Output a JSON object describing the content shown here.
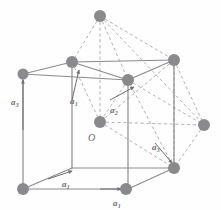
{
  "figure": {
    "type": "crystal-lattice-diagram",
    "width": 221,
    "height": 210,
    "background_color": "#fefefe",
    "solid_edge_color": "#8b8b8d",
    "dashed_edge_color": "#a9a9ab",
    "node_color": "#8a8a8c",
    "label_color": "#6e6e70"
  },
  "labels": {
    "origin": "O",
    "vec_left": {
      "base": "a",
      "sub": "3"
    },
    "vec_mid": {
      "base": "a",
      "sub": "1"
    },
    "vec_right": {
      "base": "a",
      "sub": "2"
    },
    "vec_lower_right": {
      "base": "a",
      "sub": "3"
    },
    "vec_bottom": {
      "base": "a",
      "sub": "1"
    },
    "vec_bottom_right": {
      "base": "a",
      "sub": "1"
    }
  },
  "nodes": [
    {
      "name": "node-top-apex",
      "x": 100,
      "y": 16,
      "r": 6.0
    },
    {
      "name": "node-back-top-left",
      "x": 23,
      "y": 74,
      "r": 5.5
    },
    {
      "name": "node-top-left-front",
      "x": 72,
      "y": 62,
      "r": 6.0
    },
    {
      "name": "node-top-right-back",
      "x": 174,
      "y": 60,
      "r": 6.0
    },
    {
      "name": "node-face-center-top",
      "x": 128,
      "y": 80,
      "r": 6.0
    },
    {
      "name": "node-origin-center",
      "x": 100,
      "y": 122,
      "r": 6.0
    },
    {
      "name": "node-right-middle",
      "x": 204,
      "y": 125,
      "r": 6.0
    },
    {
      "name": "node-bottom-right",
      "x": 174,
      "y": 168,
      "r": 6.0
    },
    {
      "name": "node-bottom-left",
      "x": 23,
      "y": 189,
      "r": 6.0
    },
    {
      "name": "node-bottom-mid-front",
      "x": 126,
      "y": 189,
      "r": 6.0
    }
  ],
  "solid_edges": [
    {
      "name": "edge-back-top-left-to-top-left-front",
      "x1": 23,
      "y1": 74,
      "x2": 72,
      "y2": 62
    },
    {
      "name": "edge-top-left-front-to-face-center-top",
      "x1": 72,
      "y1": 62,
      "x2": 128,
      "y2": 80
    },
    {
      "name": "edge-top-left-front-to-top-right-back",
      "x1": 72,
      "y1": 62,
      "x2": 174,
      "y2": 60
    },
    {
      "name": "edge-face-center-top-to-top-right-back",
      "x1": 128,
      "y1": 80,
      "x2": 174,
      "y2": 60
    },
    {
      "name": "edge-back-top-left-to-face-center-top",
      "x1": 23,
      "y1": 74,
      "x2": 128,
      "y2": 80
    },
    {
      "name": "edge-back-top-left-down",
      "x1": 23,
      "y1": 74,
      "x2": 23,
      "y2": 189
    },
    {
      "name": "edge-top-left-front-down",
      "x1": 72,
      "y1": 62,
      "x2": 72,
      "y2": 168
    },
    {
      "name": "edge-face-center-top-down",
      "x1": 128,
      "y1": 80,
      "x2": 128,
      "y2": 189
    },
    {
      "name": "edge-top-right-back-down",
      "x1": 174,
      "y1": 60,
      "x2": 174,
      "y2": 168
    },
    {
      "name": "edge-bottom-left-to-bottom-front",
      "x1": 23,
      "y1": 189,
      "x2": 128,
      "y2": 189
    },
    {
      "name": "edge-bottom-left-to-bottom-back-left",
      "x1": 23,
      "y1": 189,
      "x2": 72,
      "y2": 168
    },
    {
      "name": "edge-bottom-back-left-to-bottom-right",
      "x1": 72,
      "y1": 168,
      "x2": 174,
      "y2": 168
    },
    {
      "name": "edge-bottom-front-to-bottom-right",
      "x1": 128,
      "y1": 189,
      "x2": 174,
      "y2": 168
    }
  ],
  "dashed_edges": [
    {
      "name": "dash-apex-to-top-left-front",
      "x1": 100,
      "y1": 16,
      "x2": 72,
      "y2": 62
    },
    {
      "name": "dash-apex-to-face-center-top",
      "x1": 100,
      "y1": 16,
      "x2": 128,
      "y2": 80
    },
    {
      "name": "dash-apex-to-top-right-back",
      "x1": 100,
      "y1": 16,
      "x2": 174,
      "y2": 60
    },
    {
      "name": "dash-apex-to-origin-center",
      "x1": 100,
      "y1": 16,
      "x2": 100,
      "y2": 122
    },
    {
      "name": "dash-face-center-to-origin",
      "x1": 128,
      "y1": 80,
      "x2": 100,
      "y2": 122
    },
    {
      "name": "dash-top-left-front-to-origin",
      "x1": 72,
      "y1": 62,
      "x2": 100,
      "y2": 122
    },
    {
      "name": "dash-origin-to-bottom-right",
      "x1": 100,
      "y1": 122,
      "x2": 174,
      "y2": 168
    },
    {
      "name": "dash-origin-to-right-middle",
      "x1": 100,
      "y1": 122,
      "x2": 204,
      "y2": 125
    },
    {
      "name": "dash-face-center-to-right-mid",
      "x1": 128,
      "y1": 80,
      "x2": 204,
      "y2": 125
    },
    {
      "name": "dash-face-center-to-bot-right",
      "x1": 128,
      "y1": 80,
      "x2": 174,
      "y2": 168
    },
    {
      "name": "dash-top-right-to-right-middle",
      "x1": 174,
      "y1": 60,
      "x2": 204,
      "y2": 125
    },
    {
      "name": "dash-top-right-to-bottom-right",
      "x1": 174,
      "y1": 60,
      "x2": 174,
      "y2": 168
    },
    {
      "name": "dash-right-mid-to-bottom-right",
      "x1": 204,
      "y1": 125,
      "x2": 174,
      "y2": 168
    },
    {
      "name": "dash-top-right-to-origin",
      "x1": 174,
      "y1": 60,
      "x2": 100,
      "y2": 122
    },
    {
      "name": "dash-apex-to-right-middle",
      "x1": 100,
      "y1": 16,
      "x2": 204,
      "y2": 125
    }
  ],
  "vector_arrows": [
    {
      "name": "arrow-a3-left",
      "x1": 23,
      "y1": 130,
      "x2": 23,
      "y2": 80
    },
    {
      "name": "arrow-a1-mid",
      "x1": 72,
      "y1": 100,
      "x2": 79,
      "y2": 70
    },
    {
      "name": "arrow-a2-right",
      "x1": 110,
      "y1": 100,
      "x2": 134,
      "y2": 87
    },
    {
      "name": "arrow-a3-lower-right",
      "x1": 155,
      "y1": 143,
      "x2": 172,
      "y2": 163
    },
    {
      "name": "arrow-a1-bottom",
      "x1": 48,
      "y1": 179,
      "x2": 72,
      "y2": 171
    },
    {
      "name": "arrow-a1-bottom-right",
      "x1": 100,
      "y1": 189,
      "x2": 121,
      "y2": 189
    }
  ]
}
